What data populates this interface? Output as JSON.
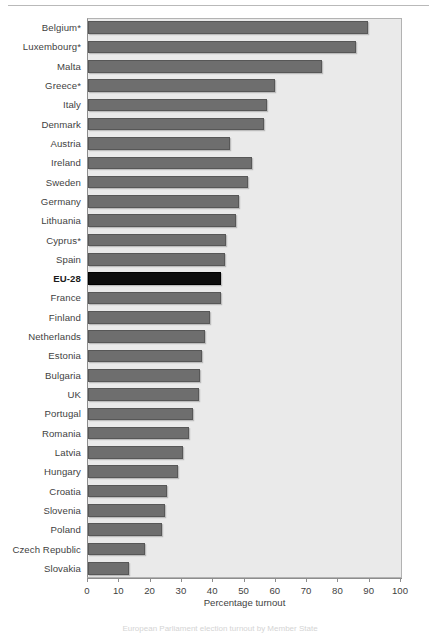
{
  "figure": {
    "top_rule": true,
    "caption_partial": "European Parliament election turnout by Member State"
  },
  "axis": {
    "x_title": "Percentage turnout",
    "x_ticks": [
      0,
      10,
      20,
      30,
      40,
      50,
      60,
      70,
      80,
      90,
      100
    ],
    "x_min": 0,
    "x_max": 100
  },
  "colors": {
    "bar": "#6e6e6e",
    "bar_highlight": "#0d0d0d",
    "plot_background": "#eaeaea",
    "plot_border": "#b2b2b2",
    "text": "#3f3f3f"
  },
  "chart_data": {
    "type": "bar",
    "orientation": "horizontal",
    "title": "",
    "xlabel": "Percentage turnout",
    "ylabel": "",
    "xlim": [
      0,
      100
    ],
    "grid": false,
    "legend": "none",
    "highlight_category": "EU-28",
    "categories": [
      "Belgium*",
      "Luxembourg*",
      "Malta",
      "Greece*",
      "Italy",
      "Denmark",
      "Austria",
      "Ireland",
      "Sweden",
      "Germany",
      "Lithuania",
      "Cyprus*",
      "Spain",
      "EU-28",
      "France",
      "Finland",
      "Netherlands",
      "Estonia",
      "Bulgaria",
      "UK",
      "Portugal",
      "Romania",
      "Latvia",
      "Hungary",
      "Croatia",
      "Slovenia",
      "Poland",
      "Czech Republic",
      "Slovakia"
    ],
    "values": [
      89.6,
      85.6,
      74.8,
      59.9,
      57.2,
      56.3,
      45.4,
      52.4,
      51.1,
      48.1,
      47.3,
      44.0,
      43.8,
      42.6,
      42.4,
      39.1,
      37.3,
      36.5,
      35.8,
      35.6,
      33.7,
      32.4,
      30.2,
      28.9,
      25.2,
      24.6,
      23.8,
      18.2,
      13.0
    ]
  }
}
